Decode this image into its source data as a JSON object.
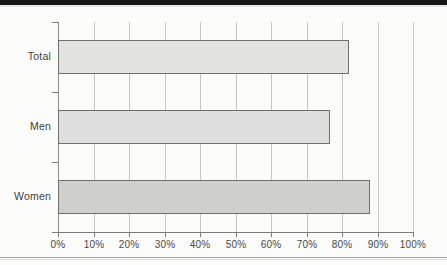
{
  "page": {
    "background_color": "#fbfbfa",
    "top_band_color": "#17171a",
    "rule_color": "#a9a9a6"
  },
  "chart_data": {
    "type": "bar",
    "orientation": "horizontal",
    "title": "",
    "subtitle": "",
    "xlabel": "",
    "ylabel": "",
    "categories": [
      "Total",
      "Men",
      "Women"
    ],
    "values": [
      82,
      76.5,
      88
    ],
    "value_unit": "%",
    "xlim": [
      0,
      100
    ],
    "xticks": [
      0,
      10,
      20,
      30,
      40,
      50,
      60,
      70,
      80,
      90,
      100
    ],
    "xtick_labels": [
      "0%",
      "10%",
      "20%",
      "30%",
      "40%",
      "50%",
      "60%",
      "70%",
      "80%",
      "90%",
      "100%"
    ],
    "grid": "vertical",
    "legend": "none",
    "bar_colors": [
      "#e2e2e0",
      "#dedede",
      "#cfcfcd"
    ],
    "bar_border_color": "#6f6f6d",
    "gridline_color": "#c6c6c4",
    "axis_color": "#7c7c79",
    "series": [
      {
        "name": "value",
        "points": [
          {
            "category": "Total",
            "value": 82,
            "label": "82%",
            "color": "#e2e2e0"
          },
          {
            "category": "Men",
            "value": 76.5,
            "label": "76.5%",
            "color": "#dedede"
          },
          {
            "category": "Women",
            "value": 88,
            "label": "88%",
            "color": "#cfcfcd"
          }
        ]
      }
    ]
  }
}
